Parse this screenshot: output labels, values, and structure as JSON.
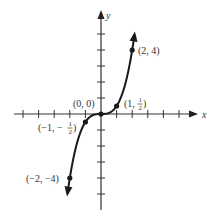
{
  "chart_data": {
    "type": "line",
    "title": "",
    "function": "y = x^3 / 2",
    "xlabel": "x",
    "ylabel": "y",
    "xlim": [
      -5.5,
      6.1
    ],
    "ylim": [
      -6,
      6.3
    ],
    "x_ticks": [
      -5,
      -4,
      -3,
      -2,
      -1,
      1,
      2,
      3,
      4,
      5
    ],
    "y_ticks": [
      -5,
      -4,
      -3,
      -2,
      -1,
      1,
      2,
      3,
      4,
      5
    ],
    "tick_labels_shown": false,
    "grid": false,
    "curve_x_range": [
      -2.15,
      2.15
    ],
    "arrows_at_ends": true,
    "points": [
      {
        "x": 2,
        "y": 4,
        "label": "(2, 4)"
      },
      {
        "x": 1,
        "y": 0.5,
        "label_main": "(1, ",
        "label_frac_num": "1",
        "label_frac_den": "2",
        "label_close": ")"
      },
      {
        "x": 0,
        "y": 0,
        "label": "(0, 0)"
      },
      {
        "x": -1,
        "y": -0.5,
        "label_main": "(−1, −",
        "label_frac_num": "1",
        "label_frac_den": "2",
        "label_close": ")"
      },
      {
        "x": -2,
        "y": -4,
        "label": "(−2, −4)"
      }
    ]
  }
}
